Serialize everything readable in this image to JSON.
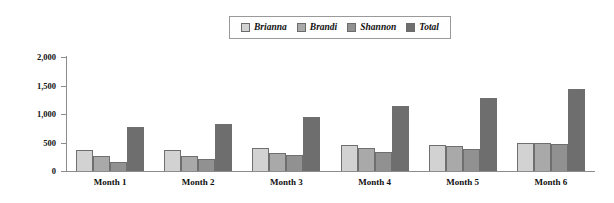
{
  "chart_data": {
    "type": "bar",
    "title": "",
    "xlabel": "",
    "ylabel": "",
    "ylim": [
      0,
      2000
    ],
    "yticks": [
      0,
      500,
      1000,
      1500,
      2000
    ],
    "ytick_labels": [
      "0",
      "500",
      "1,000",
      "1,500",
      "2,000"
    ],
    "grid": false,
    "legend_position": "top-center",
    "categories": [
      "Month 1",
      "Month 2",
      "Month 3",
      "Month 4",
      "Month 5",
      "Month 6"
    ],
    "series": [
      {
        "name": "Brianna",
        "color": "#d2d2d2",
        "values": [
          375,
          370,
          405,
          450,
          455,
          490
        ]
      },
      {
        "name": "Brandi",
        "color": "#a9a9a9",
        "values": [
          255,
          260,
          320,
          400,
          440,
          485
        ]
      },
      {
        "name": "Shannon",
        "color": "#919191",
        "values": [
          165,
          210,
          275,
          340,
          385,
          480
        ]
      },
      {
        "name": "Total",
        "color": "#6e6e6e",
        "values": [
          775,
          830,
          950,
          1140,
          1280,
          1435
        ]
      }
    ]
  }
}
